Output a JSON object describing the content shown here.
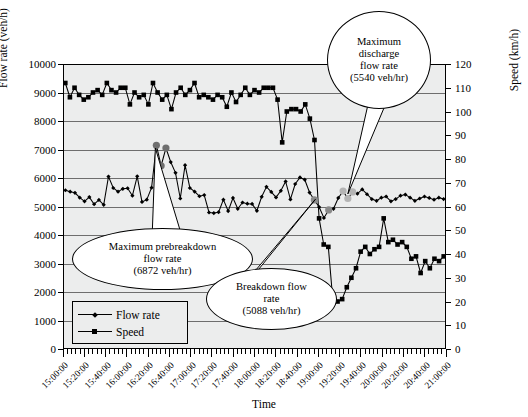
{
  "chart_data": {
    "type": "line",
    "title": "",
    "xlabel": "Time",
    "ylabel": "Flow rate (veh/h)",
    "ylabel_right": "Speed (km/h)",
    "ylim": [
      0,
      10000
    ],
    "ylim_right": [
      0,
      120
    ],
    "yticks": [
      0,
      1000,
      2000,
      3000,
      4000,
      5000,
      6000,
      7000,
      8000,
      9000,
      10000
    ],
    "yticks_right": [
      0,
      10,
      20,
      30,
      40,
      50,
      60,
      70,
      80,
      90,
      100,
      110,
      120
    ],
    "grid": true,
    "legend_position": "lower-left-inside",
    "x_tick_labels": [
      "15:00:00",
      "15:20:00",
      "15:40:00",
      "16:00:00",
      "16:20:00",
      "16:40:00",
      "17:00:00",
      "17:20:00",
      "17:40:00",
      "18:00:00",
      "18:20:00",
      "18:40:00",
      "19:00:00",
      "19:20:00",
      "19:40:00",
      "20:00:00",
      "20:20:00",
      "20:40:00",
      "21:00:00"
    ],
    "minor_ticks_per_label": 5,
    "x_range": [
      "15:00:00",
      "21:00:00"
    ],
    "series": [
      {
        "name": "Flow rate",
        "axis": "left",
        "marker": "diamond",
        "units": "veh/h",
        "values": [
          5570,
          5520,
          5480,
          5310,
          5180,
          5330,
          5080,
          5230,
          5060,
          6050,
          5650,
          5520,
          5620,
          5640,
          5380,
          6060,
          5160,
          5240,
          5660,
          7150,
          6430,
          7050,
          6560,
          6180,
          5280,
          6450,
          5650,
          5520,
          5360,
          5400,
          4790,
          4770,
          4800,
          5240,
          4840,
          5300,
          4920,
          5140,
          5100,
          5090,
          4850,
          5340,
          5690,
          5510,
          5320,
          5550,
          5880,
          5250,
          5790,
          6020,
          5940,
          5490,
          5230,
          4980,
          4600,
          4880,
          4920,
          5300,
          5540,
          5280,
          5510,
          5450,
          5600,
          5430,
          5260,
          5200,
          5310,
          5350,
          5180,
          5260,
          5380,
          5420,
          5310,
          5200,
          5280,
          5350,
          5300,
          5240,
          5310,
          5260
        ]
      },
      {
        "name": "Speed",
        "axis": "right",
        "marker": "square",
        "units": "km/h",
        "values": [
          112,
          106,
          110,
          107,
          105,
          106,
          108,
          109,
          107,
          112,
          109,
          108,
          110,
          110,
          103,
          108,
          106,
          107,
          103,
          112,
          108,
          105,
          107,
          101,
          108,
          110,
          107,
          109,
          112,
          106,
          107,
          106,
          105,
          107,
          106,
          102,
          108,
          104,
          107,
          110,
          107,
          109,
          108,
          110,
          110,
          110,
          105,
          87,
          100,
          101,
          101,
          100,
          103,
          97,
          88,
          55,
          44,
          43,
          20,
          20,
          21,
          26,
          30,
          34,
          41,
          43,
          40,
          42,
          43,
          55,
          45,
          46,
          44,
          45,
          43,
          38,
          39,
          32,
          37,
          34,
          38,
          37,
          39
        ]
      }
    ],
    "highlight_points": [
      {
        "label": "prebreakdown-peak-1",
        "color": "#8d8d8d"
      },
      {
        "label": "prebreakdown-peak-2",
        "color": "#8d8d8d"
      },
      {
        "label": "breakdown-marker",
        "color": "#8d8d8d"
      },
      {
        "label": "discharge-marker",
        "color": "#c0c0c0"
      }
    ],
    "annotations": [
      {
        "name": "maximum-prebreakdown-flow-rate",
        "lines": [
          "Maximum prebreakdown",
          "flow rate",
          "(6872 veh/hr)"
        ],
        "value": 6872,
        "units": "veh/hr"
      },
      {
        "name": "breakdown-flow-rate",
        "lines": [
          "Breakdown flow",
          "rate",
          "(5088 veh/hr)"
        ],
        "value": 5088,
        "units": "veh/hr"
      },
      {
        "name": "maximum-discharge-flow-rate",
        "lines": [
          "Maximum",
          "discharge",
          "flow rate",
          "(5540 veh/hr)"
        ],
        "value": 5540,
        "units": "veh/hr"
      }
    ]
  },
  "legend": {
    "items": [
      {
        "label": "Flow rate",
        "marker": "diamond"
      },
      {
        "label": "Speed",
        "marker": "square"
      }
    ]
  },
  "axes": {
    "left_title": "Flow rate (veh/h)",
    "right_title": "Speed (km/h)",
    "x_title": "Time"
  }
}
